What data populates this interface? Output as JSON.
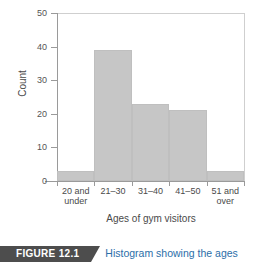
{
  "figure": {
    "banner_label": "FIGURE 12.1",
    "caption_text": "Histogram showing the ages"
  },
  "chart_data": {
    "type": "bar",
    "title": "",
    "categories": [
      "20 and\nunder",
      "21–30",
      "31–40",
      "41–50",
      "51 and\nover"
    ],
    "values": [
      3,
      39,
      23,
      21,
      3
    ],
    "xlabel": "Ages of gym visitors",
    "ylabel": "Count",
    "ylim": [
      0,
      50
    ],
    "yticks": [
      0,
      10,
      20,
      30,
      40,
      50
    ],
    "ytick_labels": [
      "0",
      "10",
      "20",
      "30",
      "40",
      "50"
    ],
    "grid": false,
    "legend": false,
    "bar_color": "#c6c6c6",
    "axis_color": "#9a9a9a"
  }
}
